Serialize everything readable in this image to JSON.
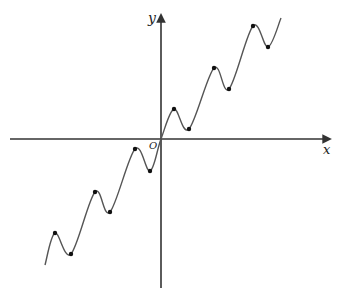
{
  "diagram": {
    "title_fragment": "",
    "axes": {
      "x_label": "x",
      "y_label": "y",
      "origin_label": "O"
    },
    "colors": {
      "axis": "#333333",
      "curve": "#555555",
      "point": "#111111",
      "background": "#ffffff"
    },
    "geometry": {
      "origin": [
        161,
        139
      ],
      "x_axis": [
        10,
        330
      ],
      "y_axis": [
        15,
        288
      ]
    },
    "curve_points": [
      [
        45,
        265
      ],
      [
        55,
        233
      ],
      [
        71,
        254
      ],
      [
        95,
        192
      ],
      [
        110,
        212
      ],
      [
        135,
        149
      ],
      [
        150,
        171
      ],
      [
        161,
        139
      ],
      [
        174,
        109
      ],
      [
        189,
        129
      ],
      [
        214,
        68
      ],
      [
        229,
        89
      ],
      [
        253,
        26
      ],
      [
        268,
        47
      ],
      [
        281,
        18
      ]
    ],
    "marked_points": {
      "maxima": [
        [
          55,
          233
        ],
        [
          95,
          192
        ],
        [
          135,
          149
        ],
        [
          174,
          109
        ],
        [
          214,
          68
        ],
        [
          253,
          26
        ]
      ],
      "minima": [
        [
          71,
          254
        ],
        [
          110,
          212
        ],
        [
          150,
          171
        ],
        [
          189,
          129
        ],
        [
          229,
          89
        ],
        [
          268,
          47
        ]
      ]
    }
  }
}
